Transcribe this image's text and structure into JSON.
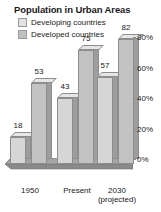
{
  "chart_data": {
    "type": "bar",
    "title": "Population in Urban Areas",
    "xlabel": "",
    "ylabel": "",
    "categories": [
      "1950",
      "Present",
      "2030 (projected)"
    ],
    "category_lines": [
      [
        "1950"
      ],
      [
        "Present"
      ],
      [
        "2030",
        "(projected)"
      ]
    ],
    "series": [
      {
        "name": "Developing countries",
        "values": [
          18,
          43,
          57
        ],
        "color": "#e2e2e2"
      },
      {
        "name": "Developed countries",
        "values": [
          53,
          75,
          82
        ],
        "color": "#c0c0c0"
      }
    ],
    "ylim": [
      0,
      80
    ],
    "yticks": [
      0,
      20,
      40,
      60,
      80
    ],
    "ytick_labels": [
      "0%",
      "20%",
      "40%",
      "60%",
      "80%"
    ],
    "yaxis_position": "right",
    "grid": false,
    "legend_position": "top-left",
    "value_labels": true,
    "style_3d": true
  },
  "colors": {
    "bar_face": "#cfcfcf",
    "bar_side": "#9d9d9d",
    "bar_top": "#e6e6e6",
    "outline": "#8d8d8d",
    "floor": "#8a8a8a",
    "text": "#1a1a1a"
  }
}
